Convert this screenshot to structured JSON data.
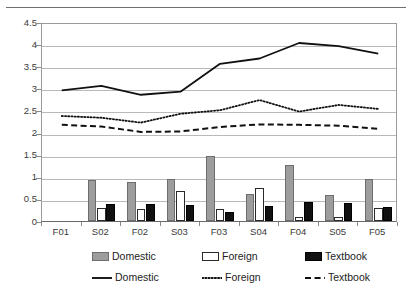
{
  "chart_data": {
    "type": "bar",
    "title": "",
    "subtitle": "",
    "xlabel": "",
    "ylabel": "",
    "ylim": [
      0,
      4.5
    ],
    "ytick_labels": [
      "0",
      "0.5",
      "1",
      "1.5",
      "2",
      "2.5",
      "3",
      "3.5",
      "4",
      "4.5"
    ],
    "ytick_values": [
      0,
      0.5,
      1,
      1.5,
      2,
      2.5,
      3,
      3.5,
      4,
      4.5
    ],
    "grid": "horizontal",
    "legend_position": "bottom",
    "categories": [
      "F01",
      "S02",
      "F02",
      "S03",
      "F03",
      "S04",
      "F04",
      "S05",
      "F05"
    ],
    "bar_series": [
      {
        "name": "Domestic",
        "style": "bar-gray",
        "color": "#9d9d9d",
        "values": [
          0,
          0.93,
          0.88,
          0.96,
          1.47,
          0.62,
          1.26,
          0.58,
          0.95
        ]
      },
      {
        "name": "Foreign",
        "style": "bar-white",
        "color": "#ffffff",
        "values": [
          0,
          0.3,
          0.27,
          0.67,
          0.27,
          0.75,
          0.08,
          0.08,
          0.3
        ]
      },
      {
        "name": "Textbook",
        "style": "bar-black",
        "color": "#111111",
        "values": [
          0,
          0.38,
          0.38,
          0.36,
          0.2,
          0.35,
          0.42,
          0.4,
          0.32
        ]
      }
    ],
    "line_series": [
      {
        "name": "Domestic",
        "style": "solid",
        "color": "#111111",
        "values": [
          3.0,
          3.1,
          2.9,
          2.97,
          3.6,
          3.72,
          4.07,
          4.0,
          3.83
        ]
      },
      {
        "name": "Foreign",
        "style": "dotted",
        "color": "#111111",
        "values": [
          2.42,
          2.38,
          2.27,
          2.47,
          2.55,
          2.78,
          2.52,
          2.67,
          2.58
        ]
      },
      {
        "name": "Textbook",
        "style": "dashed",
        "color": "#111111",
        "values": [
          2.22,
          2.18,
          2.06,
          2.07,
          2.17,
          2.23,
          2.22,
          2.2,
          2.13
        ]
      }
    ]
  },
  "legend": {
    "bar_row": [
      {
        "label": "Domestic",
        "swatch": "bar-gray-swatch"
      },
      {
        "label": "Foreign",
        "swatch": "bar-white-swatch"
      },
      {
        "label": "Textbook",
        "swatch": "bar-black-swatch"
      }
    ],
    "line_row": [
      {
        "label": "Domestic",
        "swatch": "solid-line-swatch"
      },
      {
        "label": "Foreign",
        "swatch": "dotted-line-swatch"
      },
      {
        "label": "Textbook",
        "swatch": "dashed-line-swatch"
      }
    ]
  }
}
